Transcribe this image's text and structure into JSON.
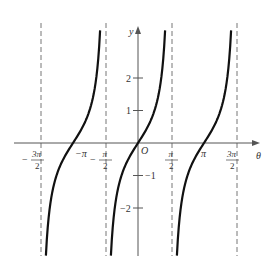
{
  "chart_data": {
    "type": "line",
    "title": "",
    "function": "y = tan θ",
    "xlabel": "θ",
    "ylabel": "y",
    "origin_label": "O",
    "x_ticks": [
      {
        "value": -4.712,
        "label_num": "3π",
        "label_den": "2",
        "sign": "−"
      },
      {
        "value": -3.1416,
        "label": "−π"
      },
      {
        "value": -1.5708,
        "label_num": "π",
        "label_den": "2",
        "sign": "−"
      },
      {
        "value": 1.5708,
        "label_num": "π",
        "label_den": "2",
        "sign": ""
      },
      {
        "value": 3.1416,
        "label": "π"
      },
      {
        "value": 4.712,
        "label_num": "3π",
        "label_den": "2",
        "sign": ""
      }
    ],
    "y_ticks": [
      {
        "value": 2,
        "label": "2"
      },
      {
        "value": 1,
        "label": "1"
      },
      {
        "value": -1,
        "label": "−1"
      },
      {
        "value": -2,
        "label": "−2"
      }
    ],
    "asymptotes": [
      -4.712,
      -1.5708,
      1.5708,
      4.712
    ],
    "xlim": [
      -5.3,
      5.5
    ],
    "ylim": [
      -3.5,
      3.6
    ],
    "grid": false,
    "legend": null,
    "series": [
      {
        "name": "branch (−3π/2, −π/2)",
        "x": [
          -4.42,
          -3.93,
          -3.5,
          -3.1416,
          -2.8,
          -2.36,
          -1.86
        ],
        "values": [
          -3.4,
          -1.0,
          -0.38,
          0,
          0.35,
          1.0,
          3.4
        ]
      },
      {
        "name": "branch (−π/2, π/2)",
        "x": [
          -1.28,
          -0.785,
          -0.4,
          0,
          0.4,
          0.785,
          1.28
        ],
        "values": [
          -3.4,
          -1.0,
          -0.42,
          0,
          0.42,
          1.0,
          3.4
        ]
      },
      {
        "name": "branch (π/2, 3π/2)",
        "x": [
          1.86,
          2.36,
          2.8,
          3.1416,
          3.5,
          3.93,
          4.42
        ],
        "values": [
          -3.4,
          -1.0,
          -0.35,
          0,
          0.38,
          1.0,
          3.4
        ]
      }
    ]
  }
}
